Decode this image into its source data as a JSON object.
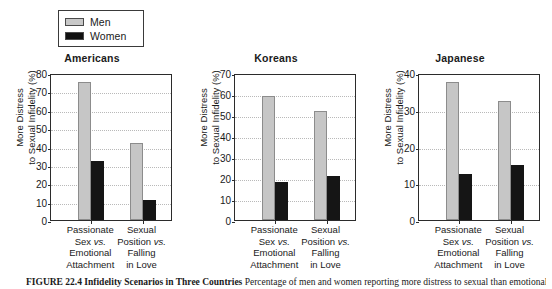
{
  "legend": {
    "items": [
      {
        "label": "Men",
        "color": "#c6c6c6"
      },
      {
        "label": "Women",
        "color": "#151515"
      }
    ]
  },
  "caption": {
    "number": "FIGURE 22.4",
    "title": "Infidelity Scenarios in Three Countries",
    "rest": "Percentage of men and women reporting more distress to sexual than emotional infidelity."
  },
  "chart_data": [
    {
      "type": "bar",
      "title": "Americans",
      "xlabel": "",
      "ylabel": "More Distress to Sexual Infidelity (%)",
      "ylim": [
        0,
        80
      ],
      "yticks": [
        0,
        10,
        20,
        30,
        40,
        50,
        60,
        70,
        80
      ],
      "grid": true,
      "legend_position": "top-left-outside",
      "categories": [
        "Passionate Sex vs. Emotional Attachment",
        "Sexual Position vs. Falling in Love"
      ],
      "category_lines": [
        [
          "Passionate",
          "Sex vs.",
          "Emotional",
          "Attachment"
        ],
        [
          "Sexual",
          "Position vs.",
          "Falling",
          "in Love"
        ]
      ],
      "series": [
        {
          "name": "Men",
          "values": [
            75,
            42
          ]
        },
        {
          "name": "Women",
          "values": [
            32,
            11
          ]
        }
      ]
    },
    {
      "type": "bar",
      "title": "Koreans",
      "xlabel": "",
      "ylabel": "More Distress to Sexual Infidelity (%)",
      "ylim": [
        0,
        70
      ],
      "yticks": [
        0,
        10,
        20,
        30,
        40,
        50,
        60,
        70
      ],
      "grid": true,
      "legend_position": "top-left-outside",
      "categories": [
        "Passionate Sex vs. Emotional Attachment",
        "Sexual Position vs. Falling in Love"
      ],
      "category_lines": [
        [
          "Passionate",
          "Sex vs.",
          "Emotional",
          "Attachment"
        ],
        [
          "Sexual",
          "Position vs.",
          "Falling",
          "in Love"
        ]
      ],
      "series": [
        {
          "name": "Men",
          "values": [
            59,
            52
          ]
        },
        {
          "name": "Women",
          "values": [
            18,
            21
          ]
        }
      ]
    },
    {
      "type": "bar",
      "title": "Japanese",
      "xlabel": "",
      "ylabel": "More Distress to Sexual Infidelity (%)",
      "ylim": [
        0,
        40
      ],
      "yticks": [
        0,
        10,
        20,
        30,
        40
      ],
      "grid": true,
      "legend_position": "top-left-outside",
      "categories": [
        "Passionate Sex vs. Emotional Attachment",
        "Sexual Position vs. Falling in Love"
      ],
      "category_lines": [
        [
          "Passionate",
          "Sex vs.",
          "Emotional",
          "Attachment"
        ],
        [
          "Sexual",
          "Position vs.",
          "Falling",
          "in Love"
        ]
      ],
      "series": [
        {
          "name": "Men",
          "values": [
            37.5,
            32.5
          ]
        },
        {
          "name": "Women",
          "values": [
            12.5,
            15
          ]
        }
      ]
    }
  ],
  "ylabel_lines": [
    "More Distress",
    "to Sexual Infidelity (%)"
  ]
}
